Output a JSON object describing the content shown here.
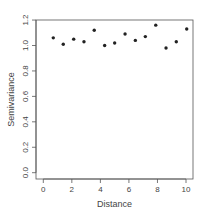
{
  "chart_data": {
    "type": "scatter",
    "title": "",
    "xlabel": "Distance",
    "ylabel": "Semivariance",
    "xlim": [
      -0.5,
      10.5
    ],
    "ylim": [
      0.0,
      1.2
    ],
    "xticks": [
      0,
      2,
      4,
      6,
      8,
      10
    ],
    "xtick_labels": [
      "0",
      "2",
      "4",
      "6",
      "8",
      "10"
    ],
    "yticks": [
      0.0,
      0.2,
      0.4,
      0.6,
      0.8,
      1.0,
      1.2
    ],
    "ytick_labels": [
      "0.0",
      "0.2",
      "0.4",
      "0.6",
      "0.8",
      "1.0",
      "1.2"
    ],
    "grid": false,
    "legend": null,
    "series": [
      {
        "name": "semivariogram",
        "marker": "filled-circle",
        "color": "#222222",
        "x": [
          0.7,
          1.4,
          2.13,
          2.85,
          3.57,
          4.3,
          5.0,
          5.73,
          6.45,
          7.15,
          7.88,
          8.6,
          9.32,
          10.05
        ],
        "y": [
          1.06,
          1.01,
          1.05,
          1.03,
          1.12,
          1.0,
          1.02,
          1.09,
          1.04,
          1.07,
          1.16,
          0.98,
          1.03,
          1.13
        ]
      }
    ]
  },
  "colors": {
    "axis": "#555555",
    "point": "#222222",
    "text": "#444444",
    "background": "#ffffff"
  }
}
